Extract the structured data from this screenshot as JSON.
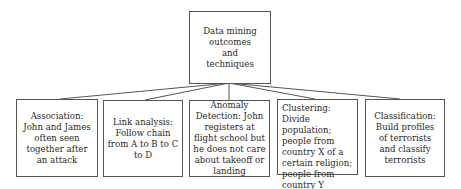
{
  "diagram": {
    "root": {
      "label": "Data mining outcomes and techniques"
    },
    "children": [
      {
        "label": "Association: John and James often seen together after an attack"
      },
      {
        "label": "Link analysis: Follow chain from A to B to C to D"
      },
      {
        "label": "Anomaly Detection: John registers at flight school but he does not care about takeoff or landing"
      },
      {
        "label": "Clustering: Divide population; people from country X of a certain religion; people from country Y interested in airplanes"
      },
      {
        "label": "Classification: Build profiles of terrorists and classify terrorists"
      }
    ],
    "colors": {
      "border": "#555555",
      "line": "#555555",
      "text": "#2a2a2a",
      "background": "#ffffff"
    }
  }
}
